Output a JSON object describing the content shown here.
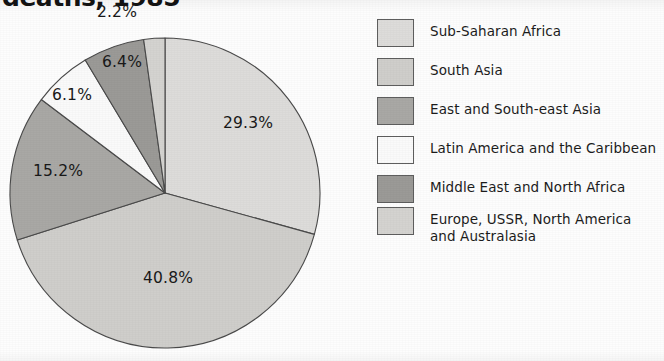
{
  "title": {
    "text": "deaths, 1985",
    "note": "cropped-at-top"
  },
  "chart_data": {
    "type": "pie",
    "title": "deaths, 1985",
    "xlabel": "",
    "ylabel": "",
    "legend_position": "right",
    "grid": false,
    "categories": [
      "Sub-Saharan Africa",
      "South Asia",
      "East and South-east Asia",
      "Latin America and the Caribbean",
      "Middle East and North Africa",
      "Europe, USSR, North America and Australasia"
    ],
    "values": [
      29.3,
      40.8,
      15.2,
      6.1,
      6.4,
      2.2
    ],
    "labels": [
      "29.3%",
      "40.8%",
      "15.2%",
      "6.1%",
      "6.4%",
      "2.2%"
    ],
    "colors": [
      "#dddcda",
      "#cfcecb",
      "#a9a8a5",
      "#fafafa",
      "#9b9a97",
      "#d4d3d0"
    ],
    "slices": [
      {
        "label": "29.3%",
        "value": 29.3,
        "category": "Sub-Saharan Africa",
        "color": "#dddcda"
      },
      {
        "label": "40.8%",
        "value": 40.8,
        "category": "South Asia",
        "color": "#cfcecb"
      },
      {
        "label": "15.2%",
        "value": 15.2,
        "category": "East and South-east Asia",
        "color": "#a9a8a5"
      },
      {
        "label": "6.1%",
        "value": 6.1,
        "category": "Latin America and the Caribbean",
        "color": "#fafafa"
      },
      {
        "label": "6.4%",
        "value": 6.4,
        "category": "Middle East and North Africa",
        "color": "#9b9a97"
      },
      {
        "label": "2.2%",
        "value": 2.2,
        "category": "Europe, USSR, North America and Australasia",
        "color": "#d4d3d0"
      }
    ]
  },
  "pie": {
    "center_x": 165,
    "center_y": 193,
    "radius": 155,
    "start_angle_deg": 0,
    "direction": "clockwise",
    "outline_color": "#4a4a4a",
    "label_positions": [
      {
        "label": "29.3%",
        "x": 248,
        "y": 128
      },
      {
        "label": "40.8%",
        "x": 168,
        "y": 283
      },
      {
        "label": "15.2%",
        "x": 58,
        "y": 176
      },
      {
        "label": "6.1%",
        "x": 72,
        "y": 100
      },
      {
        "label": "6.4%",
        "x": 122,
        "y": 67
      },
      {
        "label": "2.2%",
        "x": 117,
        "y": 17
      }
    ]
  },
  "legend": {
    "items": [
      {
        "label": "Sub-Saharan Africa",
        "color": "#dddcda"
      },
      {
        "label": "South Asia",
        "color": "#cfcecb"
      },
      {
        "label": "East and South-east Asia",
        "color": "#a9a8a5"
      },
      {
        "label": "Latin America and the Caribbean",
        "color": "#fafafa"
      },
      {
        "label": "Middle East and North Africa",
        "color": "#9b9a97"
      },
      {
        "label": "Europe, USSR, North America\nand Australasia",
        "color": "#d4d3d0"
      }
    ]
  }
}
